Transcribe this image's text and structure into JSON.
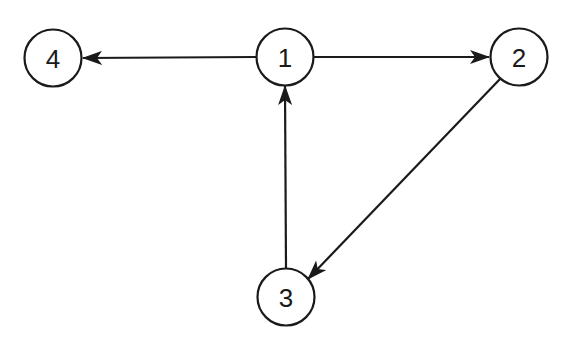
{
  "diagram": {
    "type": "directed-graph",
    "nodes": [
      {
        "id": "1",
        "label": "1",
        "cx": 285,
        "cy": 57
      },
      {
        "id": "2",
        "label": "2",
        "cx": 519,
        "cy": 57
      },
      {
        "id": "3",
        "label": "3",
        "cx": 286,
        "cy": 297
      },
      {
        "id": "4",
        "label": "4",
        "cx": 53,
        "cy": 58
      }
    ],
    "edges": [
      {
        "from": "1",
        "to": "4"
      },
      {
        "from": "1",
        "to": "2"
      },
      {
        "from": "2",
        "to": "3"
      },
      {
        "from": "3",
        "to": "1"
      }
    ],
    "colors": {
      "stroke": "#1a1a1a",
      "background": "#ffffff"
    }
  }
}
